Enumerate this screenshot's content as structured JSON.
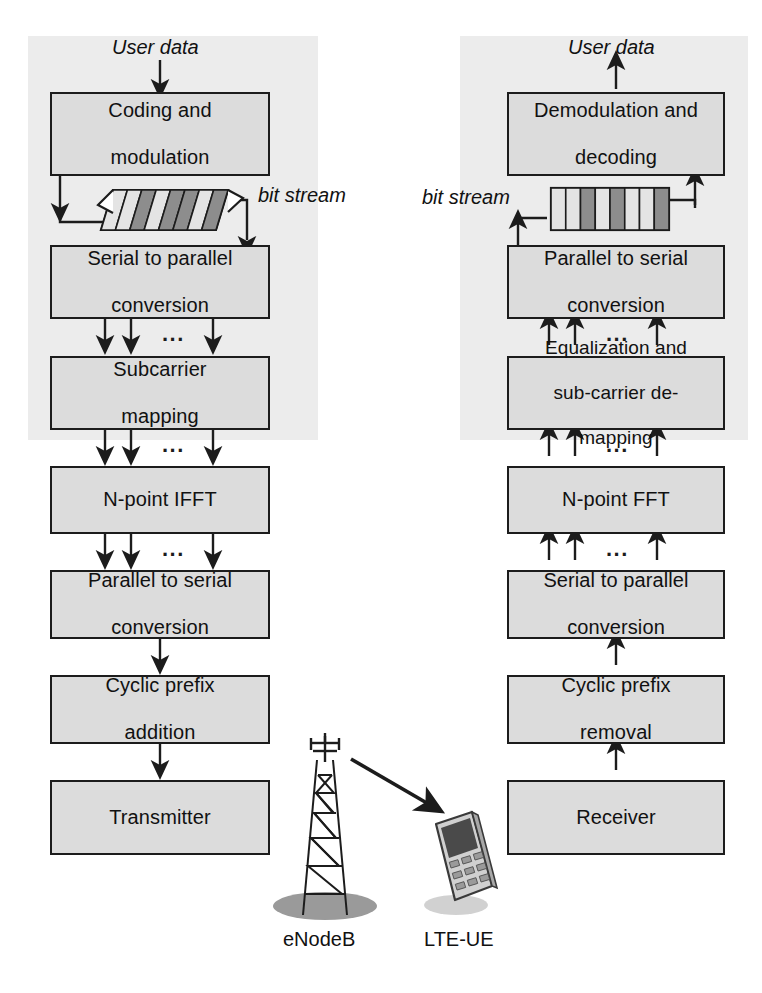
{
  "diagram": {
    "ellipsis": "...",
    "colors": {
      "box_fill": "#dcdcdc",
      "box_stroke": "#1c1c1c",
      "backdrop": "#ececec",
      "bit_light": "#e4e4e4",
      "bit_dark": "#8d8d8d",
      "shadow": "#9a9a9a"
    }
  },
  "transmitter": {
    "side_label": "eNodeB",
    "input_label": "User data",
    "bitstream_label": "bit stream",
    "bitstream_bars": [
      "light",
      "light",
      "dark",
      "light",
      "dark",
      "dark",
      "light",
      "dark"
    ],
    "blocks": [
      {
        "id": "coding-and-modulation",
        "lines": [
          "Coding and",
          "modulation"
        ]
      },
      {
        "id": "serial-to-parallel-conversion",
        "lines": [
          "Serial to parallel",
          "conversion"
        ]
      },
      {
        "id": "subcarrier-mapping",
        "lines": [
          "Subcarrier",
          "mapping"
        ]
      },
      {
        "id": "n-point-ifft",
        "lines": [
          "N-point IFFT"
        ]
      },
      {
        "id": "parallel-to-serial-conversion",
        "lines": [
          "Parallel to serial",
          "conversion"
        ]
      },
      {
        "id": "cyclic-prefix-addition",
        "lines": [
          "Cyclic prefix",
          "addition"
        ]
      },
      {
        "id": "transmitter",
        "lines": [
          "Transmitter"
        ]
      }
    ]
  },
  "receiver": {
    "side_label": "LTE-UE",
    "output_label": "User data",
    "bitstream_label": "bit stream",
    "bitstream_bars": [
      "light",
      "light",
      "dark",
      "light",
      "dark",
      "light",
      "light",
      "dark"
    ],
    "blocks": [
      {
        "id": "demodulation-and-decoding",
        "lines": [
          "Demodulation and",
          "decoding"
        ]
      },
      {
        "id": "parallel-to-serial-conversion",
        "lines": [
          "Parallel to serial",
          "conversion"
        ]
      },
      {
        "id": "equalization-and-sub-carrier-de-mapping",
        "lines": [
          "Equalization and",
          "sub-carrier de-",
          "mapping"
        ]
      },
      {
        "id": "n-point-fft",
        "lines": [
          "N-point FFT"
        ]
      },
      {
        "id": "serial-to-parallel-conversion",
        "lines": [
          "Serial to parallel",
          "conversion"
        ]
      },
      {
        "id": "cyclic-prefix-removal",
        "lines": [
          "Cyclic prefix",
          "removal"
        ]
      },
      {
        "id": "receiver",
        "lines": [
          "Receiver"
        ]
      }
    ]
  }
}
